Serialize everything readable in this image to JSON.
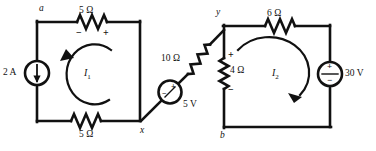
{
  "figure": {
    "stroke_color": "#111111",
    "background": "#ffffff"
  },
  "nodes": [
    {
      "id": "a",
      "label": "a"
    },
    {
      "id": "x",
      "label": "x"
    },
    {
      "id": "y",
      "label": "y"
    },
    {
      "id": "b",
      "label": "b"
    }
  ],
  "components": {
    "top_left_resistor": {
      "label": "5 Ω",
      "plus": "+",
      "minus": "−"
    },
    "bottom_left_resistor": {
      "label": "5 Ω"
    },
    "current_source": {
      "label": "2 A",
      "arrow": "down-arrow-icon"
    },
    "diagonal_resistor": {
      "label": "10 Ω"
    },
    "diagonal_voltage_source": {
      "label": "5 V",
      "plus": "+",
      "minus": "−"
    },
    "top_right_resistor": {
      "label": "6 Ω"
    },
    "middle_resistor": {
      "label": "4 Ω",
      "plus": "+",
      "minus": "−"
    },
    "right_voltage_source": {
      "label": "30 V",
      "plus": "+",
      "minus": "−"
    }
  },
  "meshes": [
    {
      "id": "I1",
      "label": "I",
      "subscript": "1",
      "direction": "counterclockwise"
    },
    {
      "id": "I2",
      "label": "I",
      "subscript": "2",
      "direction": "clockwise"
    }
  ]
}
